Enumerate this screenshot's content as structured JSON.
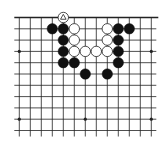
{
  "board": {
    "title": "Go board diagram",
    "grid": {
      "columns": 13,
      "rows": 11,
      "origin_x": 19.3,
      "origin_y": 17.5,
      "spacing_x": 11.0,
      "spacing_y": 11.3,
      "top_edge": true,
      "left_cut": true,
      "right_cut": true,
      "bottom_cut": true
    },
    "colors": {
      "background": "#ffffff",
      "line": "#222222",
      "black_stone": "#111111",
      "white_stone_fill": "#ffffff",
      "white_stone_stroke": "#222222"
    },
    "star_points": [
      {
        "col": 0,
        "row": 3
      },
      {
        "col": 12,
        "row": 3
      },
      {
        "col": 0,
        "row": 9
      },
      {
        "col": 6,
        "row": 9
      },
      {
        "col": 12,
        "row": 9
      }
    ],
    "stones": [
      {
        "color": "white",
        "col": 4,
        "row": 0,
        "marker": "triangle"
      },
      {
        "color": "black",
        "col": 3,
        "row": 1
      },
      {
        "color": "black",
        "col": 4,
        "row": 1
      },
      {
        "color": "white",
        "col": 5,
        "row": 1
      },
      {
        "color": "white",
        "col": 8,
        "row": 1
      },
      {
        "color": "black",
        "col": 9,
        "row": 1
      },
      {
        "color": "black",
        "col": 10,
        "row": 1
      },
      {
        "color": "black",
        "col": 4,
        "row": 2
      },
      {
        "color": "white",
        "col": 5,
        "row": 2
      },
      {
        "color": "white",
        "col": 8,
        "row": 2
      },
      {
        "color": "black",
        "col": 9,
        "row": 2
      },
      {
        "color": "black",
        "col": 4,
        "row": 3
      },
      {
        "color": "white",
        "col": 5,
        "row": 3
      },
      {
        "color": "white",
        "col": 6,
        "row": 3
      },
      {
        "color": "white",
        "col": 7,
        "row": 3
      },
      {
        "color": "white",
        "col": 8,
        "row": 3
      },
      {
        "color": "black",
        "col": 9,
        "row": 3
      },
      {
        "color": "black",
        "col": 4,
        "row": 4
      },
      {
        "color": "black",
        "col": 5,
        "row": 4
      },
      {
        "color": "black",
        "col": 9,
        "row": 4
      },
      {
        "color": "black",
        "col": 6,
        "row": 5
      },
      {
        "color": "black",
        "col": 8,
        "row": 5
      }
    ]
  }
}
